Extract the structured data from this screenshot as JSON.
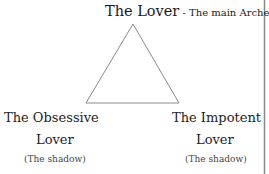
{
  "diagram": {
    "top_node": {
      "title": "The Lover",
      "separator": " - ",
      "subtitle": "The main Archetype"
    },
    "left_node": {
      "line1": "The Obsessive",
      "line2": "Lover",
      "note": "(The shadow)"
    },
    "right_node": {
      "line1": "The Impotent",
      "line2": "Lover",
      "note": "(The shadow)"
    },
    "triangle": {
      "stroke_color": "#8a8a8a",
      "apex": [
        133,
        24
      ],
      "bottom_left": [
        86,
        103
      ],
      "bottom_right": [
        179,
        103
      ]
    },
    "border_line_color": "#888888"
  }
}
